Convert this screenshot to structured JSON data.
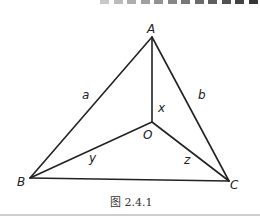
{
  "figure": {
    "caption": "图 2.4.1",
    "points": {
      "A": "A",
      "B": "B",
      "C": "C",
      "O": "O"
    },
    "segment_labels": {
      "AB": "a",
      "AC": "b",
      "OA": "x",
      "OB": "y",
      "OC": "z"
    },
    "segments": [
      "AB",
      "AC",
      "BC",
      "OA",
      "OB",
      "OC"
    ],
    "line_color": "#222222"
  }
}
